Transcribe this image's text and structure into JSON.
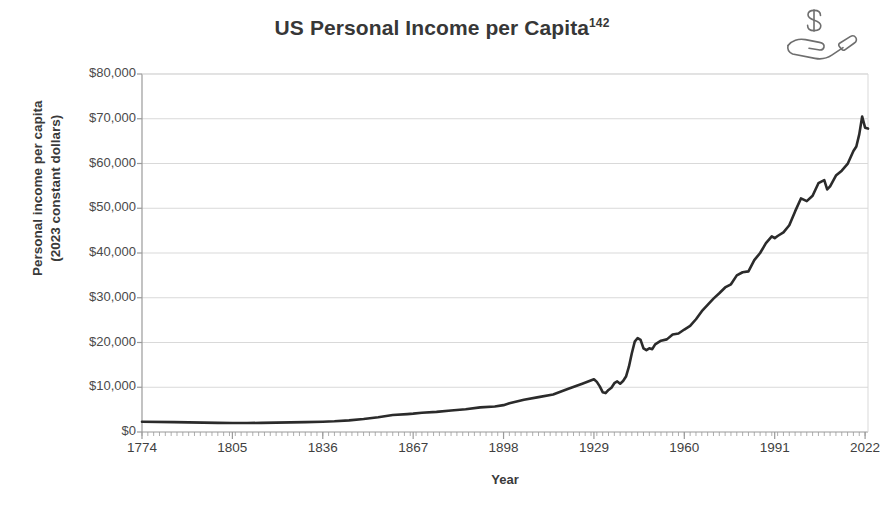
{
  "figure": {
    "title": "US Personal Income per Capita",
    "title_superscript": "142",
    "icon": "hand-holding-dollar-icon",
    "background_color": "#ffffff",
    "line_color": "#2b2b2b",
    "grid_color": "#d9d9d9",
    "axis_color": "#9a9a9a",
    "text_color": "#3a3a3a"
  },
  "chart_data": {
    "type": "line",
    "title": "US Personal Income per Capita",
    "xlabel": "Year",
    "ylabel": "Personal income per capita (2023 constant dollars)",
    "ylabel_line1": "Personal income per capita",
    "ylabel_line2": "(2023 constant dollars)",
    "xlim": [
      1774,
      2023
    ],
    "ylim": [
      0,
      80000
    ],
    "ytick_values": [
      0,
      10000,
      20000,
      30000,
      40000,
      50000,
      60000,
      70000,
      80000
    ],
    "ytick_labels": [
      "$0",
      "$10,000",
      "$20,000",
      "$30,000",
      "$40,000",
      "$50,000",
      "$60,000",
      "$70,000",
      "$80,000"
    ],
    "xtick_values": [
      1774,
      1805,
      1836,
      1867,
      1898,
      1929,
      1960,
      1991,
      2022
    ],
    "xtick_labels": [
      "1774",
      "1805",
      "1836",
      "1867",
      "1898",
      "1929",
      "1960",
      "1991",
      "2022"
    ],
    "grid": "horizontal",
    "legend": "none",
    "series": [
      {
        "name": "Personal income per capita (2023 constant dollars)",
        "x": [
          1774,
          1785,
          1795,
          1800,
          1805,
          1810,
          1815,
          1820,
          1825,
          1830,
          1836,
          1840,
          1845,
          1850,
          1855,
          1860,
          1865,
          1867,
          1870,
          1875,
          1880,
          1885,
          1890,
          1895,
          1898,
          1900,
          1905,
          1910,
          1915,
          1920,
          1925,
          1929,
          1930,
          1931,
          1932,
          1933,
          1934,
          1935,
          1936,
          1937,
          1938,
          1939,
          1940,
          1941,
          1942,
          1943,
          1944,
          1945,
          1946,
          1947,
          1948,
          1949,
          1950,
          1952,
          1954,
          1956,
          1958,
          1960,
          1962,
          1964,
          1966,
          1968,
          1970,
          1972,
          1974,
          1976,
          1978,
          1980,
          1982,
          1984,
          1986,
          1988,
          1990,
          1991,
          1992,
          1994,
          1996,
          1998,
          2000,
          2002,
          2004,
          2006,
          2008,
          2009,
          2010,
          2012,
          2014,
          2016,
          2018,
          2019,
          2020,
          2021,
          2022,
          2023
        ],
        "y": [
          2300,
          2200,
          2100,
          2050,
          2000,
          2000,
          2050,
          2100,
          2150,
          2200,
          2300,
          2400,
          2600,
          2900,
          3300,
          3800,
          4000,
          4100,
          4300,
          4500,
          4800,
          5100,
          5500,
          5700,
          6000,
          6400,
          7200,
          7800,
          8400,
          9600,
          10800,
          11800,
          11200,
          10200,
          8900,
          8700,
          9400,
          9900,
          10900,
          11300,
          10800,
          11400,
          12400,
          14600,
          17600,
          20200,
          21000,
          20600,
          18700,
          18300,
          18700,
          18500,
          19600,
          20400,
          20700,
          21800,
          22000,
          22900,
          23700,
          25200,
          27000,
          28400,
          29800,
          31000,
          32300,
          33000,
          35000,
          35700,
          35900,
          38400,
          40000,
          42200,
          43700,
          43300,
          43800,
          44600,
          46200,
          49300,
          52200,
          51600,
          52800,
          55600,
          56300,
          54200,
          54900,
          57300,
          58400,
          59900,
          62800,
          63800,
          66500,
          70500,
          68000,
          67800
        ]
      }
    ],
    "annotations": []
  }
}
